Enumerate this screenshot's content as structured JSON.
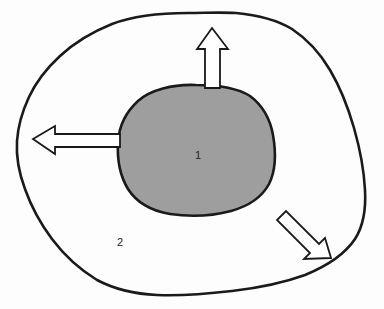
{
  "diagram": {
    "background_color": "#fdfdfd",
    "stroke_color": "#1a1a1a",
    "regions": [
      {
        "id": "inner-region",
        "label": "1",
        "name": "inner-blob",
        "fill_color": "#9e9e9e",
        "stroke_color": "#1a1a1a",
        "stroke_width": 2.6,
        "label_x": 198,
        "label_y": 159,
        "path": "M 196 85 C 173 84 150 90 138 101 C 126 112 119 126 118 142 C 117 160 120 176 128 189 C 137 203 152 211 170 214 C 190 217 212 216 231 211 C 249 206 262 197 269 184 C 276 170 276 152 273 135 C 270 118 262 105 250 96 C 236 87 216 85 196 85 Z"
      },
      {
        "id": "outer-region",
        "label": "2",
        "name": "outer-blob",
        "fill_color": "none",
        "stroke_color": "#1a1a1a",
        "stroke_width": 2.6,
        "label_x": 120,
        "label_y": 246,
        "path": "M 188 13 C 160 13 133 16 112 24 C 92 32 74 43 60 56 C 47 68 36 82 29 97 C 22 112 18 126 17 141 C 16 157 19 173 25 189 C 31 206 40 223 52 239 C 64 255 79 269 97 280 C 114 289 134 294 157 295 C 180 296 206 294 232 291 C 258 288 283 283 305 275 C 327 266 345 254 355 239 C 364 225 366 208 365 190 C 364 170 360 149 354 128 C 348 107 340 87 330 70 C 320 53 307 39 292 29 C 277 20 258 15 236 13 C 220 12 204 13 188 13 Z"
      }
    ],
    "arrows": [
      {
        "id": "arrow-up",
        "name": "arrow-up",
        "direction": "up",
        "fill_color": "#ffffff",
        "stroke_color": "#1a1a1a",
        "stroke_width": 1.8,
        "points": "212,28 228,49 220,49 220,88 205,88 205,49 197,49"
      },
      {
        "id": "arrow-left",
        "name": "arrow-left",
        "direction": "left",
        "fill_color": "#ffffff",
        "stroke_color": "#1a1a1a",
        "stroke_width": 1.8,
        "points": "33,139 55,126 55,134 120,134 120,147 55,147 55,154"
      },
      {
        "id": "arrow-down-right",
        "name": "arrow-down-right",
        "direction": "down-right",
        "fill_color": "#ffffff",
        "stroke_color": "#1a1a1a",
        "stroke_width": 1.8,
        "points": "331,258 304,259 310,253 277,220 286,211 319,244 325,238"
      }
    ]
  }
}
